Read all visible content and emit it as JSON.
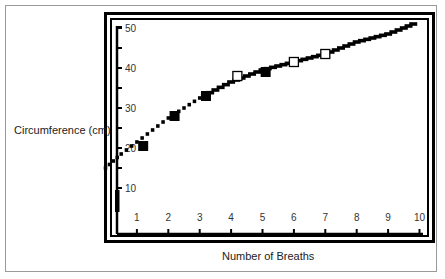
{
  "chart_data": {
    "type": "line",
    "title": "",
    "xlabel": "Number of Breaths",
    "ylabel": "Circumference (cm)",
    "xlim": [
      0,
      10
    ],
    "ylim": [
      0,
      50
    ],
    "x_ticks": [
      1,
      2,
      3,
      4,
      5,
      6,
      7,
      8,
      9,
      10
    ],
    "y_ticks": [
      10,
      20,
      30,
      40,
      50
    ],
    "y_minor_ticks": [
      15,
      25,
      35,
      45
    ],
    "grid": false,
    "legend": null,
    "series": [
      {
        "name": "fitted curve",
        "style": "stepped-dashes",
        "x": [
          0,
          0.5,
          1,
          1.5,
          2,
          2.5,
          3,
          3.5,
          4,
          4.5,
          5,
          5.5,
          6,
          6.5,
          7,
          7.5,
          8,
          8.5,
          9,
          9.5,
          9.8
        ],
        "values": [
          15,
          18.5,
          21.5,
          24.5,
          27.5,
          30,
          32.5,
          34.5,
          36.5,
          38,
          39.5,
          40.5,
          41.5,
          42.5,
          43.5,
          45,
          46.5,
          47.5,
          48.5,
          50,
          51
        ]
      },
      {
        "name": "filled markers",
        "marker": "filled-square",
        "x": [
          1.2,
          2.2,
          3.2,
          5.1
        ],
        "values": [
          20.5,
          28,
          33,
          39
        ]
      },
      {
        "name": "open markers",
        "marker": "open-square",
        "x": [
          4.2,
          6.0,
          7.0
        ],
        "values": [
          38,
          41.5,
          43.5
        ]
      }
    ]
  }
}
